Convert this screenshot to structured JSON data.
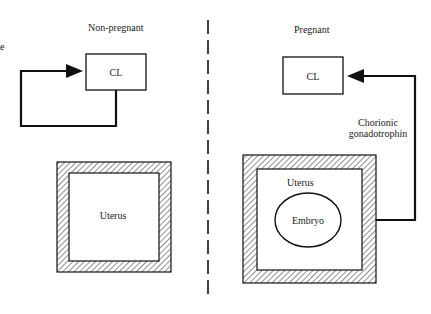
{
  "panels": {
    "left": {
      "title": "Non-pregnant",
      "cl_label": "CL",
      "uterus_label": "Uterus",
      "edge_fragment": "e"
    },
    "right": {
      "title": "Pregnant",
      "cl_label": "CL",
      "uterus_label": "Uterus",
      "embryo_label": "Embryo",
      "signal_label_line1": "Chorionic",
      "signal_label_line2": "gonadotrophin"
    }
  },
  "colors": {
    "line": "#111111",
    "text": "#222222",
    "background": "#ffffff"
  }
}
